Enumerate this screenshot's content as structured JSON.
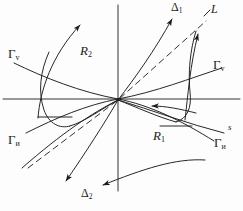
{
  "figure": {
    "type": "phase-portrait-diagram",
    "background_color": "#fdfdfd",
    "stroke_color": "#1b1b1b",
    "axes": {
      "origin": {
        "x": 118,
        "y": 99
      },
      "horizontal": {
        "x1": 3,
        "y1": 99,
        "x2": 240,
        "y2": 99
      },
      "vertical": {
        "x1": 118,
        "y1": 5,
        "x2": 118,
        "y2": 191
      }
    }
  },
  "labels": {
    "gamma_v_left": {
      "text": "Γ",
      "sub": "v",
      "x": 8,
      "y": 53
    },
    "gamma_v_right": {
      "text": "Γ",
      "sub": "v",
      "x": 215,
      "y": 64
    },
    "gamma_i_left": {
      "text": "Γ",
      "sub": "и",
      "x": 8,
      "y": 139
    },
    "gamma_i_right": {
      "text": "Γ",
      "sub": "и",
      "x": 216,
      "y": 142
    },
    "region_r2": {
      "text": "R",
      "sub": "2",
      "x": 82,
      "y": 50
    },
    "region_r1": {
      "text": "R",
      "sub": "1",
      "x": 155,
      "y": 135
    },
    "delta_1": {
      "text": "Δ",
      "sub": "1",
      "x": 172,
      "y": 3
    },
    "delta_2": {
      "text": "Δ",
      "sub": "2",
      "x": 83,
      "y": 190
    },
    "curve_L": {
      "text": "L",
      "sub": "",
      "x": 209,
      "y": 6
    },
    "separatrix_s": {
      "text": "s",
      "sub": "",
      "x": 228,
      "y": 127
    }
  },
  "curves": [
    {
      "name": "gamma-v-left-branch",
      "style": "solid"
    },
    {
      "name": "gamma-v-right-branch",
      "style": "solid"
    },
    {
      "name": "gamma-i-left-branch",
      "style": "solid"
    },
    {
      "name": "gamma-i-right-branch",
      "style": "solid"
    },
    {
      "name": "delta-1-trajectory",
      "style": "solid"
    },
    {
      "name": "delta-2-trajectory",
      "style": "solid"
    },
    {
      "name": "L-dashed-line",
      "style": "dashed"
    },
    {
      "name": "s-separatrix",
      "style": "solid"
    }
  ]
}
